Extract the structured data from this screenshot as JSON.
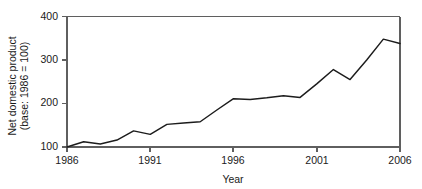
{
  "chart_data": {
    "type": "line",
    "title": "",
    "xlabel": "Year",
    "ylabel_line1": "Net domestic product",
    "ylabel_line2": "(base: 1986 = 100)",
    "ylabel": "Net domestic product (base: 1986 = 100)",
    "xlim": [
      1986,
      2006
    ],
    "ylim": [
      100,
      400
    ],
    "grid": false,
    "legend": "none",
    "line_color": "#1c1c1c",
    "axis_color": "#5f5f5f",
    "background_color": "#ffffff",
    "xticks": [
      1986,
      1991,
      1996,
      2001,
      2006
    ],
    "xtick_labels": [
      "1986",
      "1991",
      "1996",
      "2001",
      "2006"
    ],
    "yticks": [
      100,
      200,
      300,
      400
    ],
    "ytick_labels": [
      "100",
      "200",
      "300",
      "400"
    ],
    "x": [
      1986,
      1987,
      1988,
      1989,
      1990,
      1991,
      1992,
      1993,
      1994,
      1995,
      1996,
      1997,
      1998,
      1999,
      2000,
      2001,
      2002,
      2003,
      2004,
      2005,
      2006
    ],
    "values": [
      100,
      112,
      107,
      116,
      137,
      129,
      152,
      155,
      158,
      185,
      211,
      209,
      213,
      218,
      214,
      245,
      278,
      255,
      300,
      348,
      338
    ],
    "series": [
      {
        "name": "Net domestic product",
        "values": [
          100,
          112,
          107,
          116,
          137,
          129,
          152,
          155,
          158,
          185,
          211,
          209,
          213,
          218,
          214,
          245,
          278,
          255,
          300,
          348,
          338
        ]
      }
    ]
  }
}
